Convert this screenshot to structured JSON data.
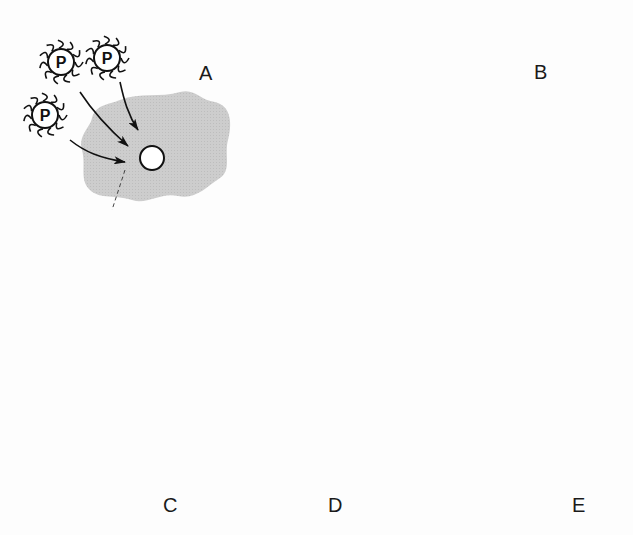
{
  "diagram": {
    "type": "biological-process",
    "panels": [
      {
        "id": "A",
        "label": "A",
        "description": "Light amoeba with nucleus; three phage-like particles labeled P attaching"
      },
      {
        "id": "B",
        "label": "B",
        "description": "Light amoeba surrounded by attached particles; nucleus extracted"
      },
      {
        "id": "C",
        "label": "C",
        "description": "Dark amoeba with dark nucleus being removed; new nucleus injected"
      },
      {
        "id": "D",
        "label": "D",
        "description": "Dark amoeba with transplanted nucleus bearing particles"
      },
      {
        "id": "E",
        "label": "E",
        "description": "Dark amoeba covered in particles around membrane and nucleus"
      }
    ],
    "particle_label": "P",
    "colors": {
      "background": "#fdfdfd",
      "light_cell": "#cfcfcf",
      "dark_cell": "#3f3f3f",
      "ink": "#111111",
      "nucleus_fill": "#ffffff"
    }
  }
}
